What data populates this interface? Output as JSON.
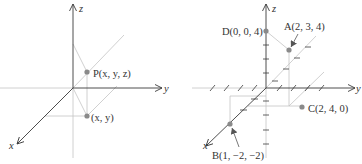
{
  "left_figure": {
    "axes": {
      "x": "x",
      "y": "y",
      "z": "z"
    },
    "point_P": {
      "label": "P(x, y, z)"
    },
    "point_projection": {
      "label": "(x, y)"
    }
  },
  "right_figure": {
    "axes": {
      "x": "x",
      "y": "y",
      "z": "z"
    },
    "points": [
      {
        "id": "A",
        "label": "A(2, 3, 4)",
        "coords": [
          2,
          3,
          4
        ]
      },
      {
        "id": "B",
        "label": "B(1, −2, −2)",
        "coords": [
          1,
          -2,
          -2
        ]
      },
      {
        "id": "C",
        "label": "C(2, 4, 0)",
        "coords": [
          2,
          4,
          0
        ]
      },
      {
        "id": "D",
        "label": "D(0, 0, 4)",
        "coords": [
          0,
          0,
          4
        ]
      }
    ]
  },
  "colors": {
    "axis": "#3a3a3a",
    "guide": "#bdbdbd",
    "point": "#8a8a8a"
  }
}
